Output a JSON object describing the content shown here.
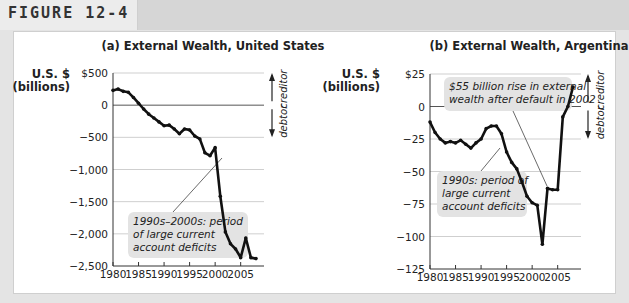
{
  "figure": {
    "label": "FIGURE 12-4"
  },
  "chart_data": [
    {
      "type": "line",
      "title": "(a) External Wealth, United States",
      "ylabel": "U.S. $ (billions)",
      "xlabel": "",
      "x": [
        1980,
        1981,
        1982,
        1983,
        1984,
        1985,
        1986,
        1987,
        1988,
        1989,
        1990,
        1991,
        1992,
        1993,
        1994,
        1995,
        1996,
        1997,
        1998,
        1999,
        2000,
        2001,
        2002,
        2003,
        2004,
        2005,
        2006,
        2007,
        2008
      ],
      "values": [
        230,
        250,
        215,
        200,
        120,
        30,
        -60,
        -140,
        -200,
        -260,
        -320,
        -310,
        -370,
        -445,
        -370,
        -385,
        -480,
        -525,
        -740,
        -785,
        -660,
        -1415,
        -1970,
        -2155,
        -2235,
        -2370,
        -2065,
        -2370,
        -2385
      ],
      "ylim": [
        -2500,
        500
      ],
      "yticks": [
        500,
        0,
        -500,
        -1000,
        -1500,
        -2000,
        -2500
      ],
      "ytick_labels": [
        "$500",
        "0",
        "−500",
        "−1,000",
        "−1,500",
        "−2,000",
        "−2,500"
      ],
      "xticks": [
        1980,
        1985,
        1990,
        1995,
        2000,
        2005
      ],
      "xtick_labels": [
        "1980",
        "1985",
        "1990",
        "1995",
        "2000",
        "2005"
      ],
      "grid": true,
      "annotations": [
        {
          "text_lines": [
            "1990s–2000s: period",
            "of large current",
            "account deficits"
          ],
          "points_to_year": 2000
        }
      ],
      "side_labels": {
        "up": "creditor",
        "down": "debtor"
      }
    },
    {
      "type": "line",
      "title": "(b) External Wealth, Argentina",
      "ylabel": "U.S. $ (billions)",
      "xlabel": "",
      "x": [
        1980,
        1981,
        1982,
        1983,
        1984,
        1985,
        1986,
        1987,
        1988,
        1989,
        1990,
        1991,
        1992,
        1993,
        1994,
        1995,
        1996,
        1997,
        1998,
        1999,
        2000,
        2001,
        2002,
        2003,
        2004,
        2005,
        2006,
        2007,
        2008
      ],
      "values": [
        -12,
        -20,
        -25,
        -28,
        -27,
        -28,
        -26,
        -29,
        -32,
        -28,
        -25,
        -17,
        -15,
        -15,
        -21,
        -35,
        -43,
        -48,
        -58,
        -69,
        -74,
        -76,
        -106,
        -63,
        -64,
        -64,
        -8,
        0,
        15
      ],
      "ylim": [
        -125,
        25
      ],
      "yticks": [
        25,
        0,
        -25,
        -50,
        -75,
        -100,
        -125
      ],
      "ytick_labels": [
        "$25",
        "0",
        "−25",
        "−50",
        "−75",
        "−100",
        "−125"
      ],
      "xticks": [
        1980,
        1985,
        1990,
        1995,
        2000,
        2005
      ],
      "xtick_labels": [
        "1980",
        "1985",
        "1990",
        "1995",
        "2000",
        "2005"
      ],
      "grid": true,
      "annotations": [
        {
          "text_lines": [
            "$55 billion rise in external",
            "wealth after default in 2002"
          ],
          "points_to_year": 2003
        },
        {
          "text_lines": [
            "1990s: period of",
            "large current",
            "account deficits"
          ],
          "points_to_year": 1995
        }
      ],
      "side_labels": {
        "up": "creditor",
        "down": "debtor"
      }
    }
  ]
}
